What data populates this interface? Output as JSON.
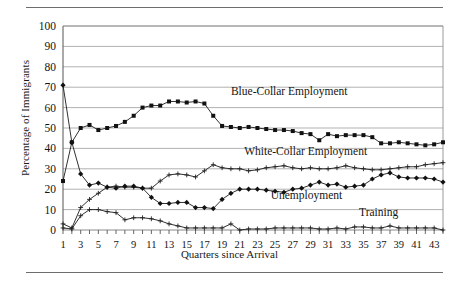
{
  "figure": {
    "ylabel": "Percentage of Immigrants",
    "xlabel": "Quarters since Arrival"
  },
  "chart_data": {
    "type": "line",
    "title": "",
    "xlabel": "Quarters since Arrival",
    "ylabel": "Percentage of Immigrants",
    "xlim": [
      1,
      44
    ],
    "ylim": [
      0,
      100
    ],
    "grid": true,
    "legend_position": "inline-annotations",
    "ytick_labels": [
      "0",
      "10",
      "20",
      "30",
      "40",
      "50",
      "60",
      "70",
      "80",
      "90",
      "100"
    ],
    "yticks": [
      0,
      10,
      20,
      30,
      40,
      50,
      60,
      70,
      80,
      90,
      100
    ],
    "xtick_labels": [
      "1",
      "3",
      "5",
      "7",
      "9",
      "11",
      "13",
      "15",
      "17",
      "19",
      "21",
      "23",
      "25",
      "27",
      "29",
      "31",
      "33",
      "35",
      "37",
      "39",
      "41",
      "43"
    ],
    "xticks": [
      1,
      3,
      5,
      7,
      9,
      11,
      13,
      15,
      17,
      19,
      21,
      23,
      25,
      27,
      29,
      31,
      33,
      35,
      37,
      39,
      41,
      43
    ],
    "x": [
      1,
      2,
      3,
      4,
      5,
      6,
      7,
      8,
      9,
      10,
      11,
      12,
      13,
      14,
      15,
      16,
      17,
      18,
      19,
      20,
      21,
      22,
      23,
      24,
      25,
      26,
      27,
      28,
      29,
      30,
      31,
      32,
      33,
      34,
      35,
      36,
      37,
      38,
      39,
      40,
      41,
      42,
      43,
      44
    ],
    "series": [
      {
        "name": "Blue-Collar Employment",
        "marker": "filled-square",
        "label_x": 20,
        "label_y": 66,
        "values": [
          24,
          43,
          50,
          51.5,
          49,
          50,
          51,
          53,
          56,
          60,
          61,
          61,
          63,
          63,
          62.5,
          63,
          62,
          56,
          51,
          50.5,
          50,
          50.5,
          50,
          49.5,
          49,
          49,
          48.5,
          47.5,
          47,
          44,
          47,
          46,
          46.5,
          46.5,
          46.5,
          45.5,
          42.5,
          42.5,
          43,
          42.5,
          42,
          41.5,
          42,
          43
        ]
      },
      {
        "name": "White-Collar Employment",
        "marker": "plus",
        "label_x": 21.5,
        "label_y": 37,
        "values": [
          3,
          1,
          11,
          15,
          18,
          21,
          21.5,
          21,
          21,
          20.5,
          20.5,
          24,
          27,
          27.5,
          27,
          26,
          29,
          32,
          30.5,
          30,
          30,
          29,
          29.5,
          30.5,
          31,
          31.5,
          30.5,
          30,
          30.5,
          30,
          30,
          30.5,
          31.5,
          30.5,
          30,
          29.5,
          29.5,
          30,
          30.5,
          31,
          31,
          32,
          32.5,
          33
        ]
      },
      {
        "name": "Unemployment",
        "marker": "filled-diamond",
        "label_x": 24.5,
        "label_y": 15,
        "values": [
          71,
          43,
          27.5,
          22,
          23,
          21,
          20.5,
          21.5,
          21.5,
          20.5,
          16,
          13,
          13,
          13.5,
          13.5,
          11,
          11,
          10.5,
          15,
          18,
          20,
          20,
          20,
          19.5,
          19,
          18.5,
          20,
          20.5,
          22,
          23.5,
          22,
          22.5,
          21,
          21.5,
          22,
          25,
          27,
          28,
          26,
          25.5,
          25.5,
          25.5,
          25,
          23.5
        ]
      },
      {
        "name": "Training",
        "marker": "plus",
        "label_x": 34.5,
        "label_y": 7,
        "values": [
          1,
          0.5,
          7,
          10,
          10,
          9,
          8.5,
          5,
          6,
          6,
          5.5,
          4.5,
          3,
          2,
          1,
          1,
          1,
          1,
          1,
          3,
          0,
          0.5,
          0.5,
          0.5,
          1,
          1,
          1,
          1,
          1,
          0.5,
          0.5,
          1,
          0.5,
          1.5,
          1.5,
          1,
          1,
          2,
          1,
          1,
          1,
          1,
          1,
          0
        ]
      }
    ]
  }
}
